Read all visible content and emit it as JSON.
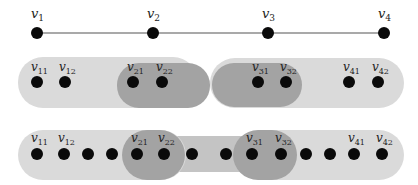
{
  "colors": {
    "background": "#ffffff",
    "light_blob": "#dadada",
    "band": "#c4c4c4",
    "dark_blob": "#a3a3a3",
    "node": "#0a0a0a",
    "edge": "#555555",
    "label": "#222222"
  },
  "row1": {
    "y": 33,
    "nodes": [
      {
        "id": "v1",
        "base": "v",
        "sub": "1",
        "x": 37
      },
      {
        "id": "v2",
        "base": "v",
        "sub": "2",
        "x": 153
      },
      {
        "id": "v3",
        "base": "v",
        "sub": "3",
        "x": 268
      },
      {
        "id": "v4",
        "base": "v",
        "sub": "4",
        "x": 384
      }
    ]
  },
  "row2": {
    "y": 82,
    "nodes": [
      {
        "id": "v11",
        "base": "v",
        "sub": "11",
        "x": 37
      },
      {
        "id": "v12",
        "base": "v",
        "sub": "12",
        "x": 65
      },
      {
        "id": "v21",
        "base": "v",
        "sub": "21",
        "x": 133
      },
      {
        "id": "v22",
        "base": "v",
        "sub": "22",
        "x": 162
      },
      {
        "id": "v31",
        "base": "v",
        "sub": "31",
        "x": 258
      },
      {
        "id": "v32",
        "base": "v",
        "sub": "32",
        "x": 286
      },
      {
        "id": "v41",
        "base": "v",
        "sub": "41",
        "x": 349
      },
      {
        "id": "v42",
        "base": "v",
        "sub": "42",
        "x": 378
      }
    ]
  },
  "row3": {
    "y": 154,
    "nodes": [
      {
        "id": "v11",
        "base": "v",
        "sub": "11",
        "x": 37
      },
      {
        "id": "v12",
        "base": "v",
        "sub": "12",
        "x": 64
      },
      {
        "id": "u1",
        "base": "",
        "sub": "",
        "x": 88
      },
      {
        "id": "u2",
        "base": "",
        "sub": "",
        "x": 112
      },
      {
        "id": "v21",
        "base": "v",
        "sub": "21",
        "x": 137
      },
      {
        "id": "v22",
        "base": "v",
        "sub": "22",
        "x": 164
      },
      {
        "id": "u3",
        "base": "",
        "sub": "",
        "x": 192
      },
      {
        "id": "u4",
        "base": "",
        "sub": "",
        "x": 226
      },
      {
        "id": "v31",
        "base": "v",
        "sub": "31",
        "x": 252
      },
      {
        "id": "v32",
        "base": "v",
        "sub": "32",
        "x": 281
      },
      {
        "id": "u5",
        "base": "",
        "sub": "",
        "x": 306
      },
      {
        "id": "u6",
        "base": "",
        "sub": "",
        "x": 330
      },
      {
        "id": "v41",
        "base": "v",
        "sub": "41",
        "x": 354
      },
      {
        "id": "v42",
        "base": "v",
        "sub": "42",
        "x": 382
      }
    ]
  }
}
